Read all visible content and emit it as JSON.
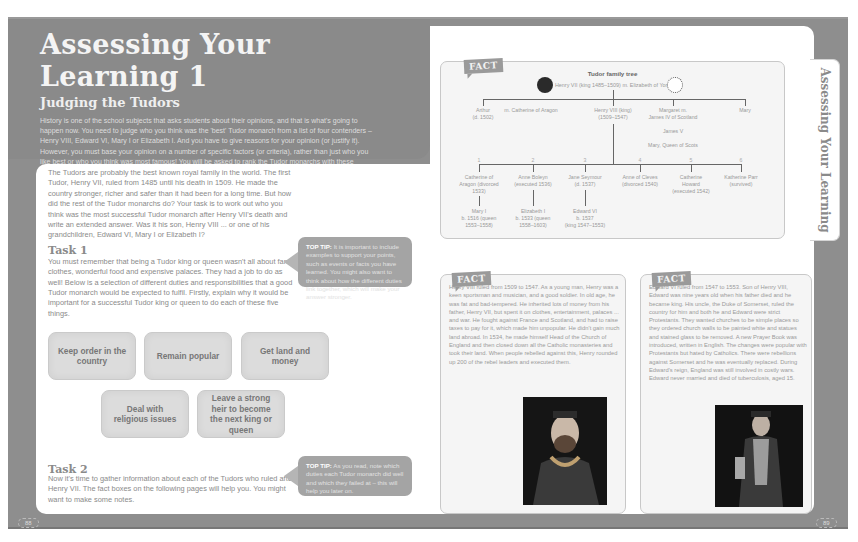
{
  "left_page": {
    "title": "Assessing Your Learning 1",
    "subtitle": "Judging the Tudors",
    "intro": "History is one of the school subjects that asks students about their opinions, and that is what's going to happen now. You need to judge who you think was the 'best' Tudor monarch from a list of four contenders – Henry VIII, Edward VI, Mary I or Elizabeth I. And you have to give reasons for your opinion (or justify it). However, you must base your opinion on a number of specific factors (or criteria), rather than just who you like best or who you think was most famous! You will be asked to rank the Tudor monarchs with these criteria in mind. Best of luck!",
    "body": "The Tudors are probably the best known royal family in the world. The first Tudor, Henry VII, ruled from 1485 until his death in 1509. He made the country stronger, richer and safer than it had been for a long time. But how did the rest of the Tudor monarchs do? Your task is to work out who you think was the most successful Tudor monarch after Henry VII's death and write an extended answer. Was it his son, Henry VIII ... or one of his grandchildren, Edward VI, Mary I or Elizabeth I?",
    "task1": {
      "heading": "Task 1",
      "text": "You must remember that being a Tudor king or queen wasn't all about fancy clothes, wonderful food and expensive palaces. They had a job to do as well! Below is a selection of different duties and responsibilities that a good Tudor monarch would be expected to fulfil. Firstly, explain why it would be important for a successful Tudor king or queen to do each of these five things.",
      "tip_label": "TOP TIP:",
      "tip_text": "It is important to include examples to support your points, such as events or facts you have learned. You might also want to think about how the different duties link together, which will make your answer stronger."
    },
    "duties": [
      "Keep order in the country",
      "Remain popular",
      "Get land and money",
      "Deal with religious issues",
      "Leave a strong heir to become the next king or queen"
    ],
    "task2": {
      "heading": "Task 2",
      "text": "Now it's time to gather information about each of the Tudors who ruled after Henry VII. The fact boxes on the following pages will help you. You might want to make some notes.",
      "tip_label": "TOP TIP:",
      "tip_text": "As you read, note which duties each Tudor monarch did well and which they failed at – this will help you later on."
    },
    "page_number": "88"
  },
  "right_page": {
    "side_tab": "Assessing Your Learning",
    "fact_tag": "FACT",
    "family_tree": {
      "title": "Tudor family tree",
      "root": "Henry VII (king 1485–1509) m. Elizabeth of York",
      "children": [
        {
          "name": "Arthur",
          "detail": "(d. 1502)"
        },
        {
          "name": "m. Catherine of Aragon",
          "detail": ""
        },
        {
          "name": "Henry VIII (king)",
          "detail": "(1509–1547)"
        },
        {
          "name": "Margaret m.",
          "detail": "James IV of Scotland"
        },
        {
          "name": "Mary",
          "detail": ""
        }
      ],
      "scots_line": [
        "James V",
        "Mary, Queen of Scots"
      ],
      "wives": [
        {
          "num": "1",
          "name": "Catherine of",
          "line2": "Aragon (divorced",
          "line3": "1533)"
        },
        {
          "num": "2",
          "name": "Anne Boleyn",
          "line2": "(executed 1536)",
          "line3": ""
        },
        {
          "num": "3",
          "name": "Jane Seymour",
          "line2": "(d. 1537)",
          "line3": ""
        },
        {
          "num": "4",
          "name": "Anne of Cleves",
          "line2": "(divorced 1540)",
          "line3": ""
        },
        {
          "num": "5",
          "name": "Catherine",
          "line2": "Howard",
          "line3": "(executed 1542)"
        },
        {
          "num": "6",
          "name": "Katherine Parr",
          "line2": "(survived)",
          "line3": ""
        }
      ],
      "heirs": [
        {
          "name": "Mary I",
          "line2": "b. 1516 (queen",
          "line3": "1553–1558)"
        },
        {
          "name": "Elizabeth I",
          "line2": "b. 1533 (queen",
          "line3": "1558–1603)"
        },
        {
          "name": "Edward VI",
          "line2": "b. 1537",
          "line3": "(king 1547–1553)"
        }
      ]
    },
    "fact_henry": "Henry VIII ruled from 1509 to 1547. As a young man, Henry was a keen sportsman and musician, and a good soldier. In old age, he was fat and bad-tempered. He inherited lots of money from his father, Henry VII, but spent it on clothes, entertainment, palaces ... and war. He fought against France and Scotland, and had to raise taxes to pay for it, which made him unpopular. He didn't gain much land abroad. In 1534, he made himself Head of the Church of England and then closed down all the Catholic monasteries and took their land. When people rebelled against this, Henry rounded up 200 of the rebel leaders and executed them.",
    "fact_edward": "Edward VI ruled from 1547 to 1553. Son of Henry VIII, Edward was nine years old when his father died and he became king. His uncle, the Duke of Somerset, ruled the country for him and both he and Edward were strict Protestants. They wanted churches to be simple places so they ordered church walls to be painted white and statues and stained glass to be removed. A new Prayer Book was introduced, written in English. The changes were popular with Protestants but hated by Catholics. There were rebellions against Somerset and he was eventually replaced. During Edward's reign, England was still involved in costly wars. Edward never married and died of tuberculosis, aged 15.",
    "page_number": "89"
  }
}
